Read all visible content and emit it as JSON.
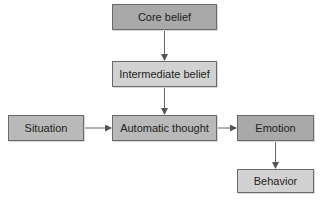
{
  "diagram": {
    "nodes": [
      {
        "id": "core",
        "label": "Core belief",
        "shade": "dark",
        "color": "#a9a9a9"
      },
      {
        "id": "intermediate",
        "label": "Intermediate belief",
        "shade": "light",
        "color": "#d2d2d2"
      },
      {
        "id": "situation",
        "label": "Situation",
        "shade": "mid",
        "color": "#b9b9b9"
      },
      {
        "id": "automatic",
        "label": "Automatic thought",
        "shade": "mid",
        "color": "#b9b9b9"
      },
      {
        "id": "emotion",
        "label": "Emotion",
        "shade": "dark",
        "color": "#a9a9a9"
      },
      {
        "id": "behavior",
        "label": "Behavior",
        "shade": "light",
        "color": "#d2d2d2"
      }
    ],
    "edges": [
      {
        "from": "core",
        "to": "intermediate"
      },
      {
        "from": "intermediate",
        "to": "automatic"
      },
      {
        "from": "situation",
        "to": "automatic"
      },
      {
        "from": "automatic",
        "to": "emotion"
      },
      {
        "from": "emotion",
        "to": "behavior"
      }
    ]
  }
}
